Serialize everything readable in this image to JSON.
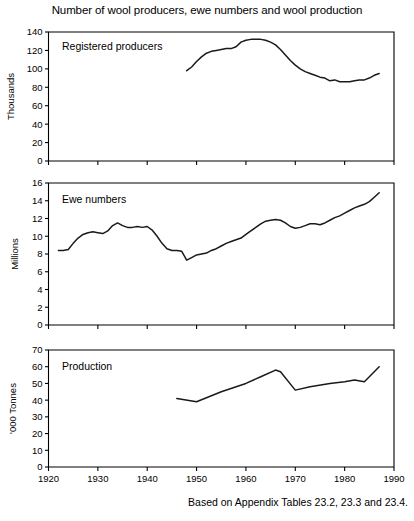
{
  "figure": {
    "title": "Number of wool producers, ewe numbers and wool production",
    "footnote": "Based on Appendix Tables 23.2, 23.3 and 23.4.",
    "line_color": "#1a1a1a",
    "axis_color": "#000000",
    "background": "#ffffff"
  },
  "chart_data": [
    {
      "type": "line",
      "title": "Registered producers",
      "panel_label": "Registered producers",
      "xlabel": "",
      "ylabel": "Thousands",
      "xlim": [
        1920,
        1990
      ],
      "ylim": [
        0,
        140
      ],
      "xticks": [
        1920,
        1930,
        1940,
        1950,
        1960,
        1970,
        1980,
        1990
      ],
      "yticks": [
        0,
        20,
        40,
        60,
        80,
        100,
        120,
        140
      ],
      "xtick_labels": [
        "1920",
        "1930",
        "1940",
        "1950",
        "1960",
        "1970",
        "1980",
        "1990"
      ],
      "ytick_labels": [
        "0",
        "20",
        "40",
        "60",
        "80",
        "100",
        "120",
        "140"
      ],
      "grid": false,
      "legend": "none",
      "series": [
        {
          "name": "Registered producers",
          "x": [
            1948,
            1949,
            1950,
            1951,
            1952,
            1953,
            1954,
            1955,
            1956,
            1957,
            1958,
            1959,
            1960,
            1961,
            1962,
            1963,
            1964,
            1965,
            1966,
            1967,
            1968,
            1969,
            1970,
            1971,
            1972,
            1973,
            1974,
            1975,
            1976,
            1977,
            1978,
            1979,
            1980,
            1981,
            1982,
            1983,
            1984,
            1985,
            1986,
            1987
          ],
          "values": [
            98,
            102,
            108,
            113,
            117,
            119,
            120,
            121,
            122,
            122,
            124,
            129,
            131,
            132,
            132,
            132,
            131,
            129,
            126,
            121,
            115,
            109,
            104,
            100,
            97,
            95,
            93,
            91,
            90,
            87,
            88,
            86,
            86,
            86,
            87,
            88,
            88,
            90,
            93,
            95
          ]
        }
      ]
    },
    {
      "type": "line",
      "title": "Ewe numbers",
      "panel_label": "Ewe numbers",
      "xlabel": "",
      "ylabel": "Millions",
      "xlim": [
        1920,
        1990
      ],
      "ylim": [
        0,
        16
      ],
      "xticks": [
        1920,
        1930,
        1940,
        1950,
        1960,
        1970,
        1980,
        1990
      ],
      "yticks": [
        0,
        2,
        4,
        6,
        8,
        10,
        12,
        14,
        16
      ],
      "xtick_labels": [
        "1920",
        "1930",
        "1940",
        "1950",
        "1960",
        "1970",
        "1980",
        "1990"
      ],
      "ytick_labels": [
        "0",
        "2",
        "4",
        "6",
        "8",
        "10",
        "12",
        "14",
        "16"
      ],
      "grid": false,
      "legend": "none",
      "series": [
        {
          "name": "Ewe numbers",
          "x": [
            1922,
            1923,
            1924,
            1925,
            1926,
            1927,
            1928,
            1929,
            1930,
            1931,
            1932,
            1933,
            1934,
            1935,
            1936,
            1937,
            1938,
            1939,
            1940,
            1941,
            1942,
            1943,
            1944,
            1945,
            1946,
            1947,
            1948,
            1949,
            1950,
            1951,
            1952,
            1953,
            1954,
            1955,
            1956,
            1957,
            1958,
            1959,
            1960,
            1961,
            1962,
            1963,
            1964,
            1965,
            1966,
            1967,
            1968,
            1969,
            1970,
            1971,
            1972,
            1973,
            1974,
            1975,
            1976,
            1977,
            1978,
            1979,
            1980,
            1981,
            1982,
            1983,
            1984,
            1985,
            1986,
            1987
          ],
          "values": [
            8.4,
            8.4,
            8.5,
            9.2,
            9.8,
            10.2,
            10.4,
            10.5,
            10.4,
            10.3,
            10.6,
            11.2,
            11.5,
            11.2,
            11.0,
            11.0,
            11.1,
            11.0,
            11.1,
            10.7,
            10.0,
            9.2,
            8.6,
            8.4,
            8.4,
            8.3,
            7.3,
            7.6,
            7.9,
            8.0,
            8.1,
            8.4,
            8.6,
            8.9,
            9.2,
            9.4,
            9.6,
            9.8,
            10.2,
            10.6,
            11.0,
            11.4,
            11.7,
            11.8,
            11.9,
            11.8,
            11.5,
            11.1,
            10.9,
            11.0,
            11.2,
            11.4,
            11.4,
            11.3,
            11.5,
            11.8,
            12.1,
            12.3,
            12.6,
            12.9,
            13.2,
            13.4,
            13.6,
            13.9,
            14.4,
            14.9
          ]
        }
      ]
    },
    {
      "type": "line",
      "title": "Production",
      "panel_label": "Production",
      "xlabel": "",
      "ylabel": "'000 Tonnes",
      "xlim": [
        1920,
        1990
      ],
      "ylim": [
        0,
        70
      ],
      "xticks": [
        1920,
        1930,
        1940,
        1950,
        1960,
        1970,
        1980,
        1990
      ],
      "yticks": [
        0,
        10,
        20,
        30,
        40,
        50,
        60,
        70
      ],
      "xtick_labels": [
        "1920",
        "1930",
        "1940",
        "1950",
        "1960",
        "1970",
        "1980",
        "1990"
      ],
      "ytick_labels": [
        "0",
        "10",
        "20",
        "30",
        "40",
        "50",
        "60",
        "70"
      ],
      "grid": false,
      "legend": "none",
      "series": [
        {
          "name": "Production",
          "x": [
            1946,
            1950,
            1955,
            1960,
            1963,
            1966,
            1967,
            1970,
            1973,
            1977,
            1980,
            1982,
            1984,
            1987
          ],
          "values": [
            41,
            39,
            45,
            50,
            54,
            58,
            57,
            46,
            48,
            50,
            51,
            52,
            51,
            60
          ]
        }
      ]
    }
  ]
}
